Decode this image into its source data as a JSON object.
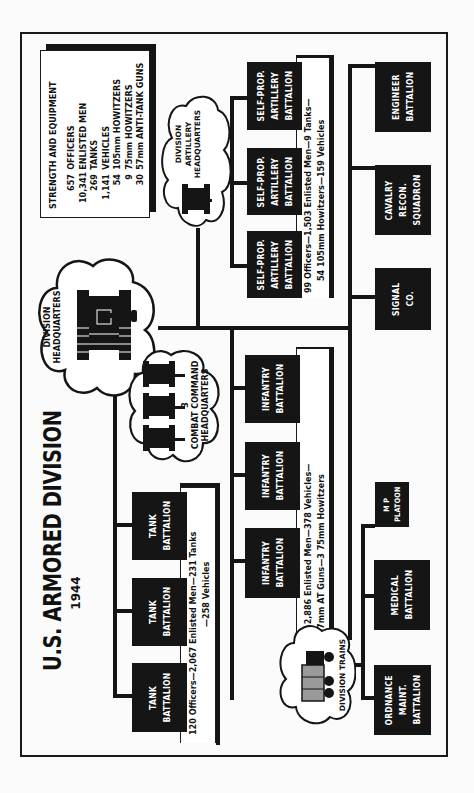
{
  "title": "U.S. ARMORED DIVISION",
  "year": "1944",
  "strength": {
    "heading": "STRENGTH AND EQUIPMENT",
    "rows": [
      {
        "num": "657",
        "label": "OFFICERS"
      },
      {
        "num": "10,341",
        "label": "ENLISTED MEN"
      },
      {
        "num": "269",
        "label": "TANKS"
      },
      {
        "num": "1,141",
        "label": "VEHICLES"
      },
      {
        "num": "54",
        "label": "105mm HOWITZERS"
      },
      {
        "num": "9",
        "label": "75mm HOWITZERS"
      },
      {
        "num": "30",
        "label": "57mm ANTI-TANK GUNS"
      }
    ]
  },
  "headquarters": {
    "division": {
      "line1": "DIVISION",
      "line2": "HEADQUARTERS",
      "icon": "tank-icon"
    },
    "combat_command": {
      "count": "3",
      "line1": "COMBAT COMMAND",
      "line2": "HEADQUARTERS",
      "icon": "tank-icon"
    },
    "artillery": {
      "line1": "DIVISION",
      "line2": "ARTILLERY",
      "line3": "HEADQUARTERS",
      "icon": "tank-icon"
    },
    "trains": {
      "line1": "DIVISION TRAINS",
      "icon": "truck-icon"
    }
  },
  "tank_group": {
    "units": [
      {
        "line1": "TANK",
        "line2": "BATTALION"
      },
      {
        "line1": "TANK",
        "line2": "BATTALION"
      },
      {
        "line1": "TANK",
        "line2": "BATTALION"
      }
    ],
    "note": {
      "line1": "120 Officers—2,067 Enlisted Men—231 Tanks",
      "line2": "—258 Vehicles"
    }
  },
  "infantry_group": {
    "units": [
      {
        "line1": "INFANTRY",
        "line2": "BATTALION"
      },
      {
        "line1": "INFANTRY",
        "line2": "BATTALION"
      },
      {
        "line1": "INFANTRY",
        "line2": "BATTALION"
      }
    ],
    "note": {
      "line1": "108 Officers—2,886 Enlisted Men—378 Vehicles—",
      "line2": "9 57mm AT Guns—3 75mm Howitzers"
    }
  },
  "artillery_group": {
    "units": [
      {
        "line1": "SELF-PROP.",
        "line2": "ARTILLERY",
        "line3": "BATTALION"
      },
      {
        "line1": "SELF-PROP.",
        "line2": "ARTILLERY",
        "line3": "BATTALION"
      },
      {
        "line1": "SELF-PROP.",
        "line2": "ARTILLERY",
        "line3": "BATTALION"
      }
    ],
    "note": {
      "line1": "99 Officers—1,503 Enlisted Men—9 Tanks—",
      "line2": "54 105mm Howitzers—159 Vehicles"
    }
  },
  "support_units": {
    "signal": {
      "line1": "SIGNAL",
      "line2": "CO."
    },
    "cavalry": {
      "line1": "CAVALRY",
      "line2": "RECON.",
      "line3": "SQUADRON"
    },
    "engineer": {
      "line1": "ENGINEER",
      "line2": "BATTALION"
    },
    "mp": {
      "line1": "M P",
      "line2": "PLATOON"
    },
    "medical": {
      "line1": "MEDICAL",
      "line2": "BATTALION"
    },
    "ordnance": {
      "line1": "ORDNANCE",
      "line2": "MAINT.",
      "line3": "BATTALION"
    }
  },
  "colors": {
    "ink": "#151515",
    "paper": "#fbfbfb"
  }
}
